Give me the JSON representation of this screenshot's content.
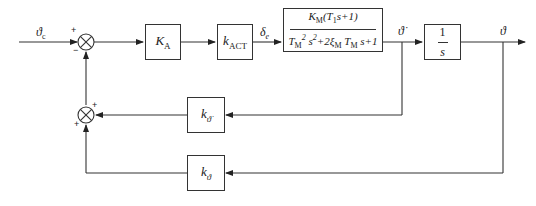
{
  "diagram": {
    "type": "control-block-diagram",
    "signals": {
      "input": "ϑ",
      "input_sub": "c",
      "actuator_out": "δ",
      "actuator_out_sub": "e",
      "rate": "ϑ̇",
      "output": "ϑ"
    },
    "blocks": {
      "ka": {
        "main": "K",
        "sub": "A"
      },
      "kact": {
        "main": "k",
        "sub": "ACT"
      },
      "plant": {
        "num_main": "K",
        "num_sub": "M",
        "num_rest": "(T",
        "num_sub2": "1",
        "num_tail": "s+1)",
        "den_a": "T",
        "den_a_sub": "M",
        "den_a_sup": "2",
        "den_b": " s",
        "den_b_sup": "2",
        "den_c": "+2ξ",
        "den_c_sub": "M",
        "den_d": " T",
        "den_d_sub": "M",
        "den_e": " s+1"
      },
      "integrator": {
        "num": "1",
        "den": "s"
      },
      "k_rate": {
        "main": "k",
        "sub": "ϑ̇"
      },
      "k_angle": {
        "main": "k",
        "sub": "ϑ"
      }
    },
    "summing_junctions": {
      "main": {
        "top_sign": "+",
        "bottom_sign": "−"
      },
      "feedback": {
        "top_sign": "+",
        "bottom_sign": "+"
      }
    }
  }
}
